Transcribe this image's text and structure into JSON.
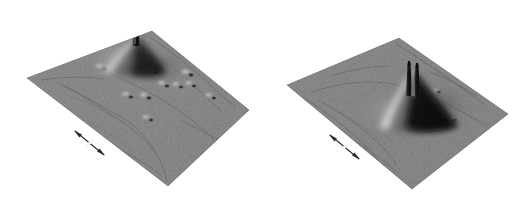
{
  "figure": {
    "type": "two-panel-grayscale-3d-surface-topography",
    "background_color": "#ffffff",
    "width": 528,
    "height": 199,
    "colormap": "grayscale",
    "surface_base_color": "#7a7a7a",
    "surface_highlight_color": "#e8e8e8",
    "surface_shadow_color": "#101010",
    "panel_count": 2
  },
  "chart_data": {
    "type": "heatmap",
    "title": "",
    "subtitle": "",
    "xlabel": "",
    "ylabel": "",
    "zlabel": "",
    "grid": false,
    "legend": "none",
    "rendering": "pseudo-3d shaded relief of a scanned surface, viewed in oblique projection with light from the upper-left",
    "panels": [
      {
        "id": "left",
        "label": "",
        "plane_corners": {
          "left": [
            27,
            78
          ],
          "top": [
            152,
            31
          ],
          "right": [
            249,
            110
          ],
          "bottom": [
            168,
            186
          ]
        },
        "features": [
          {
            "name": "primary-spike",
            "kind": "tall-sharp-needle-peak",
            "x": 136,
            "y": 52,
            "height_rel": 1.0,
            "shadow_side": "right",
            "halo": "bright-glow-on-upper-left-flank"
          },
          {
            "name": "bump-1",
            "kind": "small-protrusion",
            "x": 103,
            "y": 68,
            "height_rel": 0.09
          },
          {
            "name": "bump-2",
            "kind": "small-protrusion",
            "x": 154,
            "y": 71,
            "height_rel": 0.1
          },
          {
            "name": "bump-3",
            "kind": "small-protrusion",
            "x": 190,
            "y": 74,
            "height_rel": 0.09
          },
          {
            "name": "bump-4",
            "kind": "small-protrusion",
            "x": 166,
            "y": 85,
            "height_rel": 0.08
          },
          {
            "name": "bump-5",
            "kind": "small-protrusion",
            "x": 180,
            "y": 86,
            "height_rel": 0.08
          },
          {
            "name": "bump-6",
            "kind": "small-protrusion",
            "x": 193,
            "y": 85,
            "height_rel": 0.08
          },
          {
            "name": "bump-7",
            "kind": "small-protrusion",
            "x": 130,
            "y": 96,
            "height_rel": 0.08
          },
          {
            "name": "bump-8",
            "kind": "small-protrusion",
            "x": 148,
            "y": 97,
            "height_rel": 0.08
          },
          {
            "name": "bump-9",
            "kind": "small-protrusion",
            "x": 213,
            "y": 97,
            "height_rel": 0.07
          },
          {
            "name": "bump-10",
            "kind": "small-protrusion",
            "x": 150,
            "y": 119,
            "height_rel": 0.07
          }
        ],
        "scale_marker": {
          "name": "double-headed-arrow",
          "x1": 75,
          "y1": 131,
          "x2": 104,
          "y2": 155,
          "label": ""
        }
      },
      {
        "id": "right",
        "label": "",
        "plane_corners": {
          "left": [
            287,
            85
          ],
          "top": [
            399,
            38
          ],
          "right": [
            508,
            114
          ],
          "bottom": [
            412,
            189
          ]
        },
        "features": [
          {
            "name": "primary-spike-twin",
            "kind": "tall-sharp-twin-needle-peak",
            "x": 412,
            "y": 80,
            "height_rel": 1.0,
            "shadow_side": "right",
            "halo": "bright-ridge-on-left-flank"
          },
          {
            "name": "bump-1",
            "kind": "small-protrusion",
            "x": 438,
            "y": 92,
            "height_rel": 0.06
          },
          {
            "name": "bump-2",
            "kind": "small-protrusion",
            "x": 455,
            "y": 120,
            "height_rel": 0.05
          }
        ],
        "scale_marker": {
          "name": "double-headed-arrow",
          "x1": 330,
          "y1": 135,
          "x2": 359,
          "y2": 159,
          "label": ""
        }
      }
    ]
  }
}
